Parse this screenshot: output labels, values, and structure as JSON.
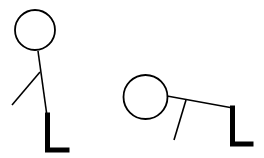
{
  "diagram": {
    "background": "#ffffff",
    "stroke_color": "#000000",
    "figures": [
      {
        "name": "standing-figure",
        "head": {
          "cx": 35,
          "cy": 30,
          "r": 20
        },
        "body": {
          "x1": 38,
          "y1": 51,
          "x2": 47,
          "y2": 116
        },
        "arm": {
          "x1": 40,
          "y1": 72,
          "x2": 12,
          "y2": 105
        },
        "leg": {
          "points": "47.5,115 47.5,150 67,150"
        }
      },
      {
        "name": "bent-figure",
        "head": {
          "cx": 145.5,
          "cy": 97,
          "r": 22
        },
        "body": {
          "x1": 167,
          "y1": 96,
          "x2": 233,
          "y2": 108
        },
        "arm": {
          "x1": 186,
          "y1": 100,
          "x2": 174,
          "y2": 140
        },
        "leg": {
          "points": "232.5,108 232.5,144 251,144"
        }
      }
    ]
  }
}
